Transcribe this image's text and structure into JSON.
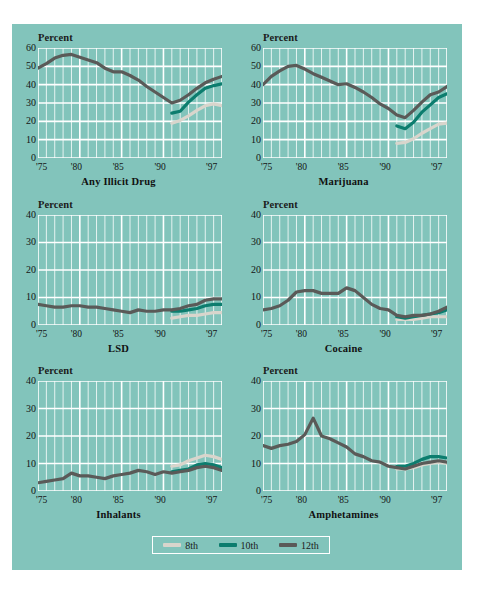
{
  "figure": {
    "background_color": "#82c4bb",
    "gridline_color": "#ffffff",
    "y_axis_label": "Percent",
    "x_tick_labels": [
      "'75",
      "'80",
      "'85",
      "'90",
      "'97"
    ],
    "x_tick_years": [
      1975,
      1980,
      1985,
      1990,
      1997
    ]
  },
  "legend": {
    "position": "bottom-center",
    "items": [
      {
        "label": "8th",
        "color": "#d9d5cc"
      },
      {
        "label": "10th",
        "color": "#0c7d6e"
      },
      {
        "label": "12th",
        "color": "#5a5a58"
      }
    ]
  },
  "chart_data": [
    {
      "type": "line",
      "title": "Any Illicit Drug",
      "xlabel": "",
      "ylabel": "Percent",
      "ylim": [
        0,
        60
      ],
      "yticks": [
        0,
        10,
        20,
        30,
        40,
        50,
        60
      ],
      "ytick_labels": [
        "0",
        "10",
        "20",
        "30",
        "40",
        "50",
        "60"
      ],
      "xlim": [
        1975,
        1997
      ],
      "grid": true,
      "series": [
        {
          "name": "12th",
          "color": "#5a5a58",
          "x": [
            1975,
            1976,
            1977,
            1978,
            1979,
            1980,
            1981,
            1982,
            1983,
            1984,
            1985,
            1986,
            1987,
            1988,
            1989,
            1990,
            1991,
            1992,
            1993,
            1994,
            1995,
            1996,
            1997
          ],
          "values": [
            49.0,
            51.5,
            54.5,
            56.0,
            56.5,
            55.0,
            53.5,
            52.0,
            49.0,
            47.0,
            47.0,
            45.0,
            42.5,
            39.0,
            36.0,
            33.0,
            30.0,
            31.5,
            34.5,
            38.0,
            41.0,
            43.0,
            44.5
          ]
        },
        {
          "name": "10th",
          "color": "#0c7d6e",
          "x": [
            1991,
            1992,
            1993,
            1994,
            1995,
            1996,
            1997
          ],
          "values": [
            24.5,
            25.5,
            30.5,
            34.5,
            38.0,
            39.5,
            40.5
          ]
        },
        {
          "name": "8th",
          "color": "#d9d5cc",
          "x": [
            1991,
            1992,
            1993,
            1994,
            1995,
            1996,
            1997
          ],
          "values": [
            19.0,
            20.5,
            23.0,
            26.0,
            28.5,
            29.5,
            28.5
          ]
        }
      ]
    },
    {
      "type": "line",
      "title": "Marijuana",
      "xlabel": "",
      "ylabel": "Percent",
      "ylim": [
        0,
        60
      ],
      "yticks": [
        0,
        10,
        20,
        30,
        40,
        50,
        60
      ],
      "ytick_labels": [
        "0",
        "10",
        "20",
        "30",
        "40",
        "50",
        "60"
      ],
      "xlim": [
        1975,
        1997
      ],
      "grid": true,
      "series": [
        {
          "name": "12th",
          "color": "#5a5a58",
          "x": [
            1975,
            1976,
            1977,
            1978,
            1979,
            1980,
            1981,
            1982,
            1983,
            1984,
            1985,
            1986,
            1987,
            1988,
            1989,
            1990,
            1991,
            1992,
            1993,
            1994,
            1995,
            1996,
            1997
          ],
          "values": [
            40.0,
            44.5,
            47.5,
            50.0,
            50.5,
            48.5,
            46.0,
            44.0,
            42.0,
            40.0,
            40.5,
            38.5,
            36.0,
            33.0,
            29.5,
            27.0,
            23.5,
            22.0,
            26.0,
            30.5,
            34.5,
            36.0,
            39.0
          ]
        },
        {
          "name": "10th",
          "color": "#0c7d6e",
          "x": [
            1991,
            1992,
            1993,
            1994,
            1995,
            1996,
            1997
          ],
          "values": [
            17.5,
            16.0,
            19.5,
            25.0,
            29.0,
            33.0,
            35.0
          ]
        },
        {
          "name": "8th",
          "color": "#d9d5cc",
          "x": [
            1991,
            1992,
            1993,
            1994,
            1995,
            1996,
            1997
          ],
          "values": [
            8.0,
            8.5,
            10.5,
            13.5,
            16.0,
            18.5,
            19.0
          ]
        }
      ]
    },
    {
      "type": "line",
      "title": "LSD",
      "xlabel": "",
      "ylabel": "Percent",
      "ylim": [
        0,
        40
      ],
      "yticks": [
        0,
        10,
        20,
        30,
        40
      ],
      "ytick_labels": [
        "0",
        "10",
        "20",
        "30",
        "40"
      ],
      "xlim": [
        1975,
        1997
      ],
      "grid": true,
      "series": [
        {
          "name": "12th",
          "color": "#5a5a58",
          "x": [
            1975,
            1976,
            1977,
            1978,
            1979,
            1980,
            1981,
            1982,
            1983,
            1984,
            1985,
            1986,
            1987,
            1988,
            1989,
            1990,
            1991,
            1992,
            1993,
            1994,
            1995,
            1996,
            1997
          ],
          "values": [
            7.5,
            7.0,
            6.5,
            6.5,
            7.0,
            7.0,
            6.5,
            6.5,
            6.0,
            5.5,
            5.0,
            4.5,
            5.5,
            5.0,
            5.0,
            5.5,
            5.5,
            6.0,
            7.0,
            7.5,
            9.0,
            9.5,
            9.5
          ]
        },
        {
          "name": "10th",
          "color": "#0c7d6e",
          "x": [
            1991,
            1992,
            1993,
            1994,
            1995,
            1996,
            1997
          ],
          "values": [
            5.0,
            5.0,
            5.5,
            6.0,
            7.0,
            7.5,
            7.5
          ]
        },
        {
          "name": "8th",
          "color": "#d9d5cc",
          "x": [
            1991,
            1992,
            1993,
            1994,
            1995,
            1996,
            1997
          ],
          "values": [
            2.5,
            3.0,
            3.5,
            3.5,
            4.0,
            4.5,
            4.5
          ]
        }
      ]
    },
    {
      "type": "line",
      "title": "Cocaine",
      "xlabel": "",
      "ylabel": "Percent",
      "ylim": [
        0,
        40
      ],
      "yticks": [
        0,
        10,
        20,
        30,
        40
      ],
      "ytick_labels": [
        "0",
        "10",
        "20",
        "30",
        "40"
      ],
      "xlim": [
        1975,
        1997
      ],
      "grid": true,
      "series": [
        {
          "name": "12th",
          "color": "#5a5a58",
          "x": [
            1975,
            1976,
            1977,
            1978,
            1979,
            1980,
            1981,
            1982,
            1983,
            1984,
            1985,
            1986,
            1987,
            1988,
            1989,
            1990,
            1991,
            1992,
            1993,
            1994,
            1995,
            1996,
            1997
          ],
          "values": [
            5.5,
            6.0,
            7.0,
            9.0,
            12.0,
            12.5,
            12.5,
            11.5,
            11.5,
            11.5,
            13.5,
            12.5,
            10.0,
            7.5,
            6.0,
            5.5,
            3.5,
            3.0,
            3.5,
            3.5,
            4.0,
            5.0,
            6.5
          ]
        },
        {
          "name": "10th",
          "color": "#0c7d6e",
          "x": [
            1991,
            1992,
            1993,
            1994,
            1995,
            1996,
            1997
          ],
          "values": [
            3.0,
            2.5,
            3.0,
            3.5,
            4.0,
            4.5,
            5.5
          ]
        },
        {
          "name": "8th",
          "color": "#d9d5cc",
          "x": [
            1991,
            1992,
            1993,
            1994,
            1995,
            1996,
            1997
          ],
          "values": [
            2.0,
            2.0,
            2.0,
            2.5,
            3.0,
            3.0,
            3.0
          ]
        }
      ]
    },
    {
      "type": "line",
      "title": "Inhalants",
      "xlabel": "",
      "ylabel": "Percent",
      "ylim": [
        0,
        40
      ],
      "yticks": [
        0,
        10,
        20,
        30,
        40
      ],
      "ytick_labels": [
        "0",
        "10",
        "20",
        "30",
        "40"
      ],
      "xlim": [
        1975,
        1997
      ],
      "grid": true,
      "series": [
        {
          "name": "12th",
          "color": "#5a5a58",
          "x": [
            1975,
            1976,
            1977,
            1978,
            1979,
            1980,
            1981,
            1982,
            1983,
            1984,
            1985,
            1986,
            1987,
            1988,
            1989,
            1990,
            1991,
            1992,
            1993,
            1994,
            1995,
            1996,
            1997
          ],
          "values": [
            3.0,
            3.5,
            4.0,
            4.5,
            6.5,
            5.5,
            5.5,
            5.0,
            4.5,
            5.5,
            6.0,
            6.5,
            7.5,
            7.0,
            6.0,
            7.0,
            6.5,
            7.0,
            7.5,
            8.5,
            9.0,
            8.5,
            7.5
          ]
        },
        {
          "name": "10th",
          "color": "#0c7d6e",
          "x": [
            1991,
            1992,
            1993,
            1994,
            1995,
            1996,
            1997
          ],
          "values": [
            7.0,
            7.5,
            8.0,
            9.5,
            10.0,
            9.5,
            8.5
          ]
        },
        {
          "name": "8th",
          "color": "#d9d5cc",
          "x": [
            1991,
            1992,
            1993,
            1994,
            1995,
            1996,
            1997
          ],
          "values": [
            9.0,
            9.5,
            11.0,
            12.0,
            13.0,
            12.5,
            11.5
          ]
        }
      ]
    },
    {
      "type": "line",
      "title": "Amphetamines",
      "xlabel": "",
      "ylabel": "Percent",
      "ylim": [
        0,
        40
      ],
      "yticks": [
        0,
        10,
        20,
        30,
        40
      ],
      "ytick_labels": [
        "0",
        "10",
        "20",
        "30",
        "40"
      ],
      "xlim": [
        1975,
        1997
      ],
      "grid": true,
      "series": [
        {
          "name": "12th",
          "color": "#5a5a58",
          "x": [
            1975,
            1976,
            1977,
            1978,
            1979,
            1980,
            1981,
            1982,
            1983,
            1984,
            1985,
            1986,
            1987,
            1988,
            1989,
            1990,
            1991,
            1992,
            1993,
            1994,
            1995,
            1996,
            1997
          ],
          "values": [
            16.5,
            15.5,
            16.5,
            17.0,
            18.0,
            20.5,
            26.5,
            20.0,
            19.0,
            17.5,
            16.0,
            13.5,
            12.5,
            11.0,
            10.5,
            9.0,
            8.5,
            8.0,
            9.0,
            10.0,
            10.5,
            11.0,
            10.5
          ]
        },
        {
          "name": "10th",
          "color": "#0c7d6e",
          "x": [
            1991,
            1992,
            1993,
            1994,
            1995,
            1996,
            1997
          ],
          "values": [
            9.0,
            9.0,
            10.0,
            11.5,
            12.5,
            12.5,
            12.0
          ]
        },
        {
          "name": "8th",
          "color": "#d9d5cc",
          "x": [
            1991,
            1992,
            1993,
            1994,
            1995,
            1996,
            1997
          ],
          "values": [
            8.0,
            8.0,
            8.5,
            9.5,
            10.0,
            10.5,
            10.0
          ]
        }
      ]
    }
  ]
}
